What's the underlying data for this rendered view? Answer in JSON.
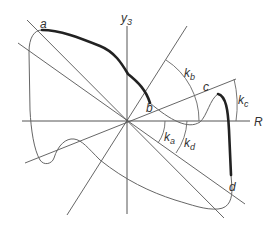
{
  "diagram": {
    "axes": {
      "horizontal_label": "R",
      "vertical_label": "y",
      "vertical_label_subscript": "3"
    },
    "points": [
      {
        "id": "a",
        "label": "a"
      },
      {
        "id": "b",
        "label": "b"
      },
      {
        "id": "c",
        "label": "c"
      },
      {
        "id": "d",
        "label": "d"
      }
    ],
    "angles": [
      {
        "id": "ka",
        "base": "k",
        "subscript": "a"
      },
      {
        "id": "kb",
        "base": "k",
        "subscript": "b"
      },
      {
        "id": "kc",
        "base": "k",
        "subscript": "c"
      },
      {
        "id": "kd",
        "base": "k",
        "subscript": "d"
      }
    ],
    "colors": {
      "line": "#555555",
      "bold_segment": "#222222",
      "background": "#ffffff"
    }
  }
}
